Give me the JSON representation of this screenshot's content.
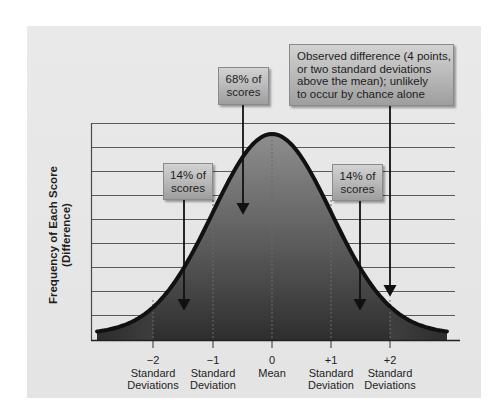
{
  "diagram": {
    "y_axis_label": {
      "line1": "Frequency of Each Score",
      "line2": "(Difference)"
    },
    "x_axis": {
      "ticks": [
        {
          "value": "−2",
          "line1": "Standard",
          "line2": "Deviations",
          "x": 153
        },
        {
          "value": "−1",
          "line1": "Standard",
          "line2": "Deviation",
          "x": 213
        },
        {
          "value": "0",
          "line1": "Mean",
          "line2": "",
          "x": 272
        },
        {
          "value": "+1",
          "line1": "Standard",
          "line2": "Deviation",
          "x": 331
        },
        {
          "value": "+2",
          "line1": "Standard",
          "line2": "Deviations",
          "x": 390
        }
      ]
    },
    "callouts": {
      "center": {
        "line1": "68% of",
        "line2": "scores"
      },
      "left": {
        "line1": "14% of",
        "line2": "scores"
      },
      "right": {
        "line1": "14% of",
        "line2": "scores"
      },
      "observed": {
        "line1": "Observed difference (4 points,",
        "line2": "or two standard deviations",
        "line3": "above the mean); unlikely",
        "line4": "to occur by chance alone"
      }
    },
    "colors": {
      "panel_background": "#e6e6e6",
      "curve_stroke": "#111111",
      "fill_inner_top": "#8c8c8c",
      "fill_inner_bottom": "#333333",
      "fill_tail_top": "#a8a8a8",
      "fill_tail_bottom": "#3c3c3c",
      "gridline": "#555555"
    }
  },
  "chart_data": {
    "type": "area",
    "title": "",
    "xlabel": "Standard deviations from the mean",
    "ylabel": "Frequency of Each Score (Difference)",
    "x_ticks": [
      "−2 Standard Deviations",
      "−1 Standard Deviation",
      "0 Mean",
      "+1 Standard Deviation",
      "+2 Standard Deviations"
    ],
    "x": [
      -2,
      -1,
      0,
      1,
      2
    ],
    "distribution": "normal",
    "mean": 0,
    "sd": 1,
    "region_percentages": [
      {
        "region": "-2 to -1 SD",
        "percent": 14
      },
      {
        "region": "-1 to +1 SD",
        "percent": 68
      },
      {
        "region": "+1 to +2 SD",
        "percent": 14
      }
    ],
    "annotations": [
      "68% of scores",
      "14% of scores",
      "14% of scores",
      "Observed difference (4 points, or two standard deviations above the mean); unlikely to occur by chance alone"
    ],
    "observed_value_sd": 2,
    "observed_difference_points": 4,
    "grid": true,
    "horizontal_gridlines": 9
  }
}
